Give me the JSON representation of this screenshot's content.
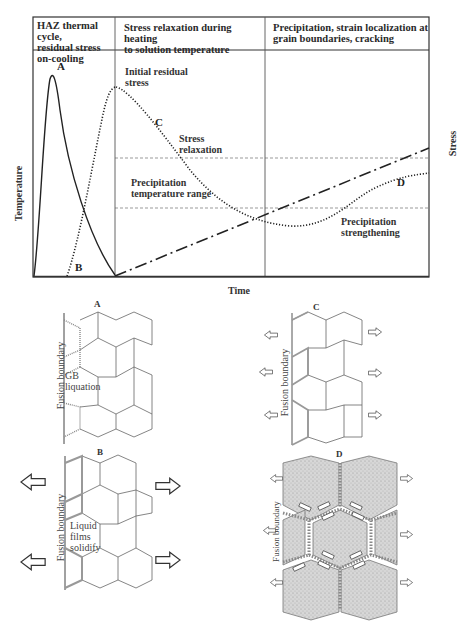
{
  "chart": {
    "headers": [
      "HAZ thermal cycle, residual stress on-cooling",
      "Stress relaxation during heating to solution temperature",
      "Precipitation, strain localization at grain boundaries, cracking"
    ],
    "header_lines": {
      "col1": [
        "HAZ thermal cycle,",
        "residual stress",
        "on-cooling"
      ],
      "col2": [
        "Stress relaxation during heating",
        "to solution temperature"
      ],
      "col3": [
        "Precipitation, strain localization at",
        "grain boundaries, cracking"
      ]
    },
    "y_axis_left": "Temperature",
    "y_axis_right": "Stress",
    "x_axis": "Time",
    "curve_labels": {
      "A": "A",
      "B": "B",
      "C": "C",
      "D": "D"
    },
    "annotations": {
      "initial_residual_stress": [
        "Initial residual",
        "stress"
      ],
      "stress_relaxation": [
        "Stress",
        "relaxation"
      ],
      "precipitation_temperature_range": [
        "Precipitation",
        "temperature range"
      ],
      "precipitation_strengthening": [
        "Precipitation",
        "strengthening"
      ]
    },
    "legend_styles": {
      "A": "solid (HAZ thermal cycle temperature)",
      "B": "dotted (residual stress build-up on cooling)",
      "C": "dotted (stress relaxation)",
      "D": "dotted (precipitation strengthening)",
      "heating": "dash-dot (PWHT heating ramp)"
    }
  },
  "panels": {
    "A": {
      "title": "A",
      "side_label": "Fusion boundary",
      "inner_label": [
        "GB",
        "liquation"
      ]
    },
    "B": {
      "title": "B",
      "side_label": "Fusion boundary",
      "inner_label": [
        "Liquid",
        "films",
        "solidify"
      ]
    },
    "C": {
      "title": "C",
      "side_label": "Fusion boundary"
    },
    "D": {
      "title": "D",
      "side_label": "Fusion boundary"
    }
  },
  "colors": {
    "line": "#333333",
    "grain": "#555555",
    "boundary_gray": "#999999",
    "precip_fill": "#cfcfcf"
  }
}
